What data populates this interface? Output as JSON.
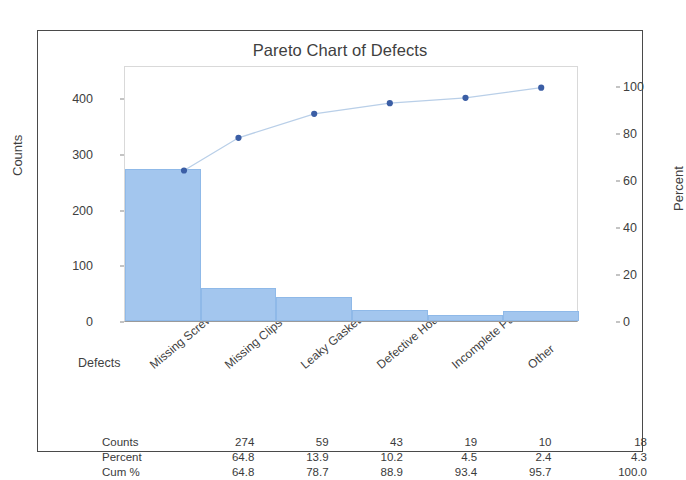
{
  "chart_data": {
    "type": "bar",
    "title": "Pareto Chart of Defects",
    "xlabel": "Defects",
    "ylabel": "Counts",
    "y2label": "Percent",
    "categories": [
      "Missing Screws",
      "Missing Clips",
      "Leaky Gasket",
      "Defective Housi",
      "Incomplete Part",
      "Other"
    ],
    "values": [
      274,
      59,
      43,
      19,
      10,
      18
    ],
    "percent": [
      64.8,
      13.9,
      10.2,
      4.5,
      2.4,
      4.3
    ],
    "cum_percent": [
      64.8,
      78.7,
      88.9,
      93.4,
      95.7,
      100.0
    ],
    "ylim": [
      0,
      460
    ],
    "y2lim": [
      0,
      108.8
    ],
    "yticks": [
      0,
      100,
      200,
      300,
      400
    ],
    "y2ticks": [
      0,
      20,
      40,
      60,
      80,
      100
    ],
    "grid": false,
    "legend": "none",
    "series": [
      {
        "name": "Counts",
        "type": "bar",
        "values": [
          274,
          59,
          43,
          19,
          10,
          18
        ]
      },
      {
        "name": "Cum %",
        "type": "line",
        "values": [
          64.8,
          78.7,
          88.9,
          93.4,
          95.7,
          100.0
        ]
      }
    ],
    "colors": {
      "bar_fill": "#a3c6ee",
      "bar_edge": "#8fb9e8",
      "line": "#b9cfe8",
      "marker": "#3b5ea5",
      "frame": "#4a4a4a",
      "plot_border": "#d9d9d9",
      "text": "#3f3f3f"
    }
  },
  "table": {
    "rows": [
      {
        "label": "Counts",
        "values": [
          "274",
          "59",
          "43",
          "19",
          "10",
          "18"
        ]
      },
      {
        "label": "Percent",
        "values": [
          "64.8",
          "13.9",
          "10.2",
          "4.5",
          "2.4",
          "4.3"
        ]
      },
      {
        "label": "Cum %",
        "values": [
          "64.8",
          "78.7",
          "88.9",
          "93.4",
          "95.7",
          "100.0"
        ]
      }
    ]
  }
}
